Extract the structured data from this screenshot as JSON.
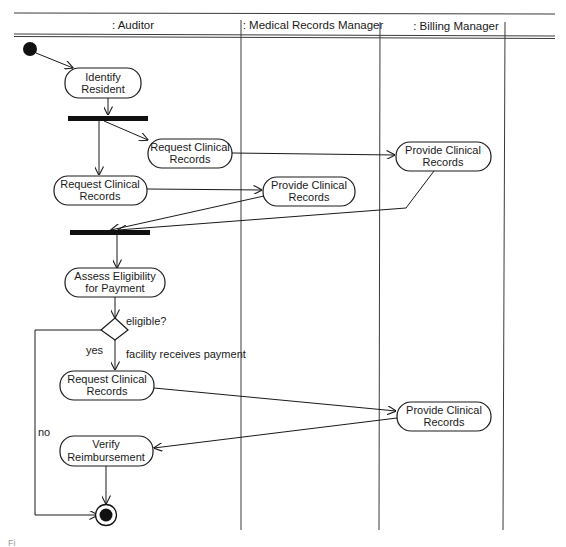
{
  "diagram": {
    "type": "uml-activity-diagram",
    "swimlanes": [
      {
        "id": "auditor",
        "label": ": Auditor"
      },
      {
        "id": "medical_records_manager",
        "label": ": Medical Records Manager"
      },
      {
        "id": "billing_manager",
        "label": ": Billing Manager"
      }
    ],
    "nodes": {
      "start": {
        "type": "initial"
      },
      "identify_resident": {
        "type": "action",
        "lane": "auditor",
        "line1": "Identify",
        "line2": "Resident"
      },
      "fork": {
        "type": "fork"
      },
      "request_records_a": {
        "type": "action",
        "lane": "auditor",
        "line1": "Request Clinical",
        "line2": "Records"
      },
      "request_records_b": {
        "type": "action",
        "lane": "auditor",
        "line1": "Request Clinical",
        "line2": "Records"
      },
      "provide_records_mrm": {
        "type": "action",
        "lane": "medical_records_manager",
        "line1": "Provide Clinical",
        "line2": "Records"
      },
      "provide_records_bm1": {
        "type": "action",
        "lane": "billing_manager",
        "line1": "Provide Clinical",
        "line2": "Records"
      },
      "join": {
        "type": "join"
      },
      "assess_eligibility": {
        "type": "action",
        "lane": "auditor",
        "line1": "Assess Eligibility",
        "line2": "for Payment"
      },
      "decision": {
        "type": "decision",
        "label": "eligible?"
      },
      "request_records_c": {
        "type": "action",
        "lane": "auditor",
        "line1": "Request Clinical",
        "line2": "Records"
      },
      "provide_records_bm2": {
        "type": "action",
        "lane": "billing_manager",
        "line1": "Provide Clinical",
        "line2": "Records"
      },
      "verify_reimbursement": {
        "type": "action",
        "lane": "auditor",
        "line1": "Verify",
        "line2": "Reimbursement"
      },
      "end": {
        "type": "final"
      }
    },
    "guards": {
      "yes": "yes",
      "no": "no",
      "facility_payment": "facility receives payment"
    },
    "edges": [
      [
        "start",
        "identify_resident"
      ],
      [
        "identify_resident",
        "fork"
      ],
      [
        "fork",
        "request_records_a"
      ],
      [
        "fork",
        "request_records_b"
      ],
      [
        "request_records_a",
        "provide_records_bm1"
      ],
      [
        "request_records_b",
        "provide_records_mrm"
      ],
      [
        "provide_records_mrm",
        "join"
      ],
      [
        "provide_records_bm1",
        "join"
      ],
      [
        "join",
        "assess_eligibility"
      ],
      [
        "assess_eligibility",
        "decision"
      ],
      [
        "decision",
        "request_records_c",
        "yes"
      ],
      [
        "decision",
        "end",
        "no"
      ],
      [
        "request_records_c",
        "provide_records_bm2"
      ],
      [
        "provide_records_bm2",
        "verify_reimbursement"
      ],
      [
        "verify_reimbursement",
        "end"
      ]
    ],
    "caption_fragment": "Fi"
  }
}
